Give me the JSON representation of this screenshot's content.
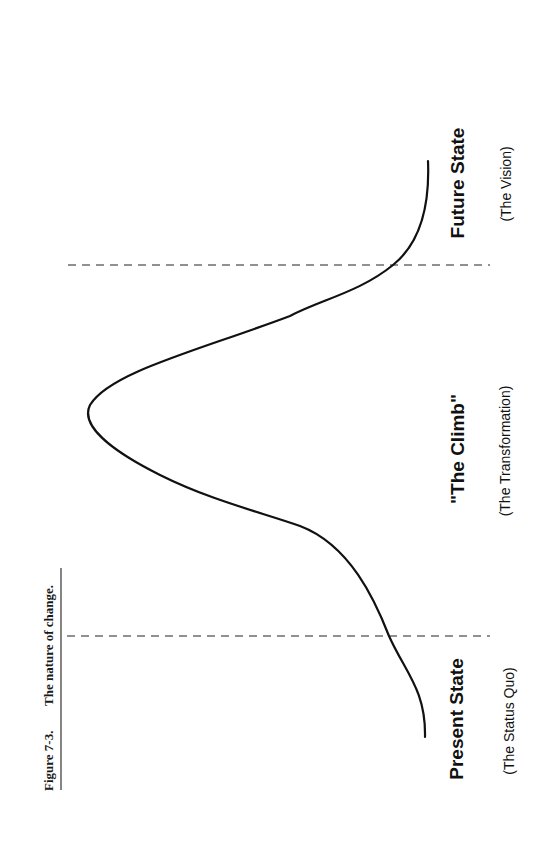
{
  "caption": {
    "figure_number": "Figure 7-3.",
    "title": "The nature of change."
  },
  "diagram": {
    "orientation": "rotated 90° counter-clockwise",
    "stages": [
      {
        "id": "present",
        "label": "Present State",
        "sublabel": "(The Status Quo)"
      },
      {
        "id": "climb",
        "label": "\"The Climb\"",
        "sublabel": "(The Transformation)"
      },
      {
        "id": "future",
        "label": "Future State",
        "sublabel": "(The Vision)"
      }
    ],
    "boundaries": [
      "present/climb divider",
      "climb/future divider"
    ],
    "curve": "bell-shaped transition curve rising from the present state, peaking in the climb, and settling at the future state"
  },
  "colors": {
    "ink": "#111111",
    "background": "#ffffff"
  }
}
